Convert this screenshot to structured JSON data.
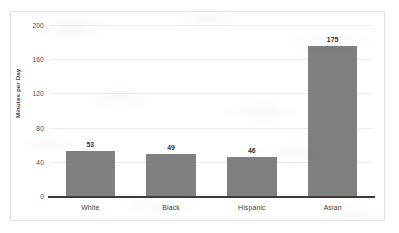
{
  "chart_data": {
    "type": "bar",
    "title": "",
    "subtitle": "",
    "xlabel": "",
    "ylabel": "Minutes per Day",
    "categories": [
      "White",
      "Black",
      "Hispanic",
      "Asian"
    ],
    "values": [
      53,
      49,
      46,
      175
    ],
    "value_labels": [
      "53",
      "49",
      "46",
      "175"
    ],
    "ylim": [
      0,
      200
    ],
    "ytick_labels": [
      "0",
      "40",
      "80",
      "120",
      "160",
      "200"
    ],
    "ytick_values": [
      0,
      40,
      80,
      120,
      160,
      200
    ],
    "grid": true,
    "grid_axis": "y",
    "legend": false,
    "legend_position": "none",
    "series": [
      {
        "name": "Minutes per Day",
        "values": [
          53,
          49,
          46,
          175
        ]
      }
    ],
    "colors": {
      "bar_fill": "#808080",
      "axis_line": "#3b3b3b",
      "gridline": "#ededed",
      "text": "#3d3d3d",
      "value_label": "#2f2f2f",
      "frame_border": "#e3e3e3",
      "background": "#ffffff"
    }
  }
}
